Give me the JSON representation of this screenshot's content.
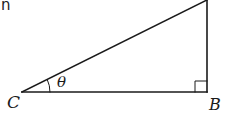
{
  "diagram": {
    "type": "right-triangle",
    "partial_text": "n",
    "vertices": {
      "C": {
        "label": "C",
        "x": 22,
        "y": 92
      },
      "B": {
        "label": "B",
        "x": 207,
        "y": 92
      },
      "A": {
        "label": "",
        "x": 207,
        "y": 0
      }
    },
    "angle_label": "θ",
    "right_angle_at": "B",
    "stroke_color": "#1a1a1a"
  }
}
